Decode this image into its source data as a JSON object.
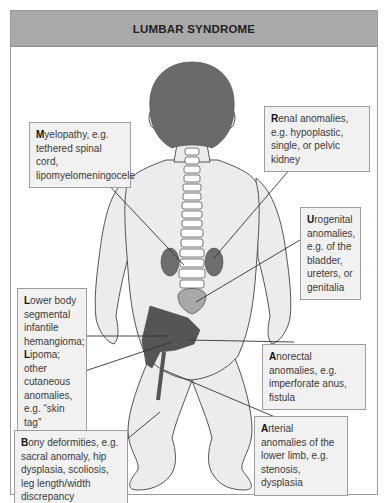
{
  "title": "LUMBAR SYNDROME",
  "colors": {
    "title_bar": "#a9a9a9",
    "label_bg": "#f1f1f1",
    "label_border": "#9d9d9d",
    "skin": "#ececec",
    "hair": "#6a6a6a",
    "kidney": "#6e6e6e",
    "bladder": "#a8a8a8",
    "hemangioma": "#555555",
    "spine": "#ffffff"
  },
  "labels": {
    "myelopathy": {
      "initial": "M",
      "rest": "yelopathy, e.g. tethered spinal cord, lipomyelomeningocele"
    },
    "renal": {
      "initial": "R",
      "rest": "enal anomalies, e.g. hypoplastic, single, or pelvic kidney"
    },
    "urogenital": {
      "initial": "U",
      "rest": "rogenital anomalies, e.g. of the bladder, ureters, or genitalia"
    },
    "lower_body": {
      "initial": "L",
      "rest": "ower body segmental infantile hemangioma;",
      "initial2": "L",
      "rest2": "ipoma; other cutaneous anomalies, e.g. “skin tag”"
    },
    "anorectal": {
      "initial": "A",
      "rest": "norectal anomalies, e.g. imperforate anus, fistula"
    },
    "arterial": {
      "initial": "A",
      "rest": "rterial anomalies of the lower limb, e.g. stenosis, dysplasia"
    },
    "bony": {
      "initial": "B",
      "rest": "ony deformities, e.g. sacral anomaly, hip dysplasia, scoliosis, leg length/width discrepancy"
    }
  }
}
